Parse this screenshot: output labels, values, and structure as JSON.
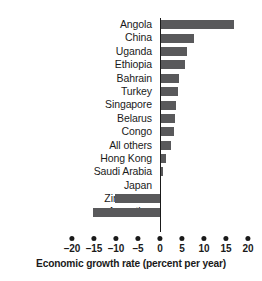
{
  "chart_data": {
    "type": "bar",
    "orientation": "horizontal",
    "title": "",
    "xlabel": "Economic growth rate (percent per year)",
    "ylabel": "",
    "xlim": [
      -20,
      20
    ],
    "xticks": [
      -20,
      -15,
      -10,
      -5,
      0,
      5,
      10,
      15,
      20
    ],
    "xtick_labels": [
      "–20",
      "–15",
      "–10",
      "–5",
      "0",
      "5",
      "10",
      "15",
      "20"
    ],
    "grid": false,
    "legend": null,
    "bar_color": "#59595b",
    "axis_color": "#1a1a1a",
    "categories": [
      "Angola",
      "China",
      "Uganda",
      "Ethiopia",
      "Bahrain",
      "Turkey",
      "Singapore",
      "Belarus",
      "Congo",
      "All others",
      "Hong Kong",
      "Saudi Arabia",
      "Japan",
      "Zimbabwe",
      "Argentina"
    ],
    "values": [
      16.8,
      7.8,
      6.1,
      5.6,
      4.3,
      4.2,
      3.6,
      3.5,
      3.1,
      2.6,
      1.4,
      0.6,
      0.3,
      -10.2,
      -15.2
    ]
  }
}
